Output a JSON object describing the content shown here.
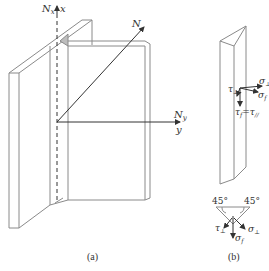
{
  "figure": {
    "panel_a": {
      "label": "(a)",
      "axes": {
        "x_axis": {
          "force": "N",
          "force_sub": "x",
          "axis": "x"
        },
        "y_axis": {
          "force": "N",
          "force_sub": "y",
          "axis": "y"
        },
        "resultant": {
          "force": "N"
        }
      }
    },
    "panel_b": {
      "label": "(b)",
      "stresses_top": {
        "tau_perp": {
          "sym": "τ",
          "sub": "⊥"
        },
        "sigma_perp": {
          "sym": "σ",
          "sub": "⊥"
        },
        "sigma_f": {
          "sym": "σ",
          "sub": "f"
        },
        "tau_f": {
          "sym": "τ",
          "sub": "f",
          "eq": "=",
          "tau_par": "τ",
          "tau_par_sub": "//"
        }
      },
      "section": {
        "angle_left": "45°",
        "angle_right": "45°",
        "tau_perp": {
          "sym": "τ",
          "sub": "⊥"
        },
        "sigma_perp": {
          "sym": "σ",
          "sub": "⊥"
        },
        "sigma_f": {
          "sym": "σ",
          "sub": "f"
        }
      }
    },
    "colors": {
      "line": "#8a8a8a",
      "dark": "#333333",
      "fill": "#bdbdbd"
    }
  }
}
